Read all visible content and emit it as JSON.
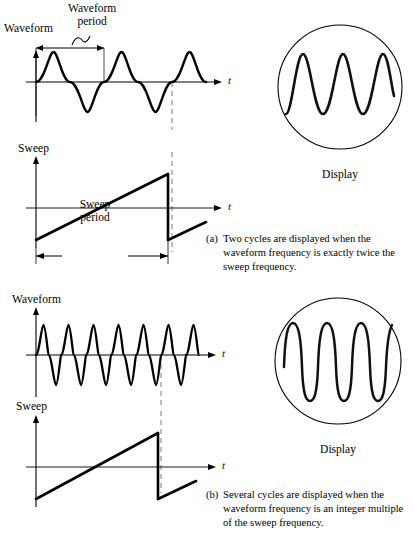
{
  "figure": {
    "background_color": "#ffffff",
    "ink_color": "#000000",
    "dash_color": "#9a9a9a"
  },
  "panels": [
    {
      "id": "a",
      "caption_letter": "(a)",
      "caption_text": "Two cycles are displayed when the waveform frequency is exactly twice the sweep frequency.",
      "waveform": {
        "axis_label": "Waveform",
        "time_axis_label": "t",
        "cycles_drawn": 3,
        "cycles_before_dashed_line": 2,
        "period_annotation": "Waveform\nperiod",
        "period_annotation_line1": "Waveform",
        "period_annotation_line2": "period"
      },
      "sweep": {
        "axis_label": "Sweep",
        "time_axis_label": "t",
        "period_annotation_line1": "Sweep",
        "period_annotation_line2": "period",
        "ramps_drawn": 2,
        "second_ramp_partial": true
      },
      "display": {
        "label": "Display",
        "cycles_shown": 2,
        "shape": "circle"
      }
    },
    {
      "id": "b",
      "caption_letter": "(b)",
      "caption_text": "Several cycles are displayed when the waveform frequency is an integer multiple of the sweep frequency.",
      "waveform": {
        "axis_label": "Waveform",
        "time_axis_label": "t",
        "cycles_drawn": 7,
        "cycles_before_dashed_line": 5
      },
      "sweep": {
        "axis_label": "Sweep",
        "time_axis_label": "t",
        "ramps_drawn": 2,
        "second_ramp_partial": true
      },
      "display": {
        "label": "Display",
        "cycles_shown": 5,
        "shape": "circle"
      }
    }
  ]
}
